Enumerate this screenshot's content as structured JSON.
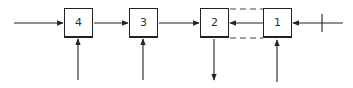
{
  "diagram": {
    "type": "block-chain",
    "stroke_color": "#222222",
    "background": "#ffffff",
    "blocks": [
      {
        "id": "4",
        "label": "4",
        "x": 64,
        "y": 8,
        "side_input": "up-arrow-from-below"
      },
      {
        "id": "3",
        "label": "3",
        "x": 129,
        "y": 8,
        "side_input": "up-arrow-from-below"
      },
      {
        "id": "2",
        "label": "2",
        "x": 200,
        "y": 8,
        "side_output": "down-arrow-below"
      },
      {
        "id": "1",
        "label": "1",
        "x": 263,
        "y": 8,
        "side_input": "up-arrow-from-below"
      }
    ],
    "connections": [
      {
        "from": "input-left",
        "to": "4",
        "direction": "right"
      },
      {
        "from": "4",
        "to": "3",
        "direction": "right"
      },
      {
        "from": "3",
        "to": "2",
        "direction": "right"
      },
      {
        "from": "1",
        "to": "2",
        "direction": "left"
      },
      {
        "from": "input-right",
        "to": "1",
        "direction": "left",
        "note": "crossed line (tick mark)"
      },
      {
        "from": "2",
        "to": "1",
        "style": "dashed",
        "count": 2
      }
    ]
  }
}
